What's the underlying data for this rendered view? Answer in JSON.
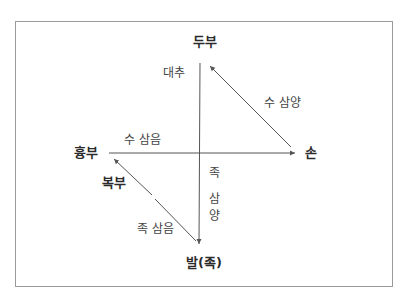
{
  "nodes": {
    "head": "두부",
    "chest": "흉부",
    "hand": "손",
    "foot": "발(족)",
    "abdomen": "복부"
  },
  "edges": {
    "vertical_top": "대추",
    "chest_to_hand": "수 삼음",
    "hand_to_head": "수 삼양",
    "head_to_foot_lines": [
      "족",
      "삼",
      "양"
    ],
    "foot_to_chest": "족 삼음"
  },
  "colors": {
    "line": "#555555",
    "frame": "#9a9a9a",
    "text": "#333333"
  }
}
